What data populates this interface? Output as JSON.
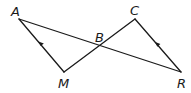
{
  "diagram": {
    "type": "geometry",
    "points": {
      "A": {
        "label": "A",
        "x": 19,
        "y": 19,
        "lx": 11,
        "ly": 16
      },
      "B": {
        "label": "B",
        "x": 100,
        "y": 46,
        "lx": 95,
        "ly": 42
      },
      "C": {
        "label": "C",
        "x": 135,
        "y": 19,
        "lx": 130,
        "ly": 15
      },
      "M": {
        "label": "M",
        "x": 64,
        "y": 72,
        "lx": 58,
        "ly": 88
      },
      "R": {
        "label": "R",
        "x": 181,
        "y": 72,
        "lx": 177,
        "ly": 88
      }
    },
    "segments": [
      {
        "from": "A",
        "to": "R",
        "note": "line through B"
      },
      {
        "from": "M",
        "to": "C",
        "note": "line through B"
      },
      {
        "from": "A",
        "to": "M",
        "parallel_mark": "single-arrow"
      },
      {
        "from": "C",
        "to": "R",
        "parallel_mark": "single-arrow"
      }
    ],
    "relationships": [
      "AM ∥ CR",
      "AR and MC intersect at B"
    ]
  }
}
